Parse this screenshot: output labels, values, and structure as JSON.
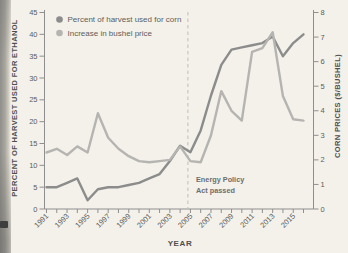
{
  "colors": {
    "background": "#f3f1ea",
    "axis": "#8f8f8f",
    "tick_text": "#5c5c5c",
    "series_percent": "#8c8c8c",
    "series_price": "#b6b4b1",
    "dashed_line": "#bfbdb8",
    "page_edge": "#8f8e8a",
    "corner_mark": "#3e3e3e"
  },
  "chart_data": {
    "type": "line",
    "title": "",
    "xlabel": "YEAR",
    "ylabel_left": "PERCENT OF HARVEST USED FOR ETHANOL",
    "ylabel_right": "CORN PRICES ($/BUSHEL)",
    "ylim_left": [
      0,
      45
    ],
    "ylim_right": [
      0,
      8
    ],
    "yticks_left": [
      0,
      5,
      10,
      15,
      20,
      25,
      30,
      35,
      40,
      45
    ],
    "yticks_right": [
      0,
      1,
      2,
      3,
      4,
      5,
      6,
      7,
      8
    ],
    "xtick_labels": [
      1991,
      1993,
      1995,
      1997,
      1999,
      2001,
      2003,
      2005,
      2007,
      2009,
      2011,
      2013,
      2015
    ],
    "grid": false,
    "legend_position": "top-left",
    "x": [
      1991,
      1992,
      1993,
      1994,
      1995,
      1996,
      1997,
      1998,
      1999,
      2000,
      2001,
      2002,
      2003,
      2004,
      2005,
      2006,
      2007,
      2008,
      2009,
      2010,
      2011,
      2012,
      2013,
      2014,
      2015,
      2016
    ],
    "series": [
      {
        "name": "Percent of harvest used for corn",
        "axis": "left",
        "color": "#8c8c8c",
        "values": [
          5,
          5,
          6,
          7,
          2,
          4.5,
          5,
          5,
          5.5,
          6,
          7,
          8,
          11,
          14.5,
          13,
          18,
          26,
          33,
          36.5,
          37,
          37.5,
          38,
          39.5,
          35,
          38,
          40
        ]
      },
      {
        "name": "Increase in bushel price",
        "axis": "right",
        "color": "#b6b4b1",
        "values": [
          2.3,
          2.45,
          2.2,
          2.55,
          2.3,
          3.9,
          2.9,
          2.45,
          2.15,
          1.95,
          1.9,
          1.95,
          2.0,
          2.55,
          1.95,
          1.9,
          3.0,
          4.8,
          4.0,
          3.6,
          6.4,
          6.55,
          7.2,
          4.6,
          3.65,
          3.6
        ]
      }
    ],
    "annotation": {
      "lines": [
        "Energy Policy",
        "Act passed"
      ],
      "x_year": 2005,
      "marker": "dashed-vertical-line"
    }
  }
}
